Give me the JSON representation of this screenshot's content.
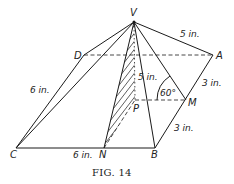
{
  "figure": {
    "caption": "Fig. 14",
    "caption_display": "FIG. 14"
  },
  "vertices": {
    "V": {
      "label": "V",
      "x": 134,
      "y": 22
    },
    "A": {
      "label": "A",
      "x": 213,
      "y": 55
    },
    "B": {
      "label": "B",
      "x": 155,
      "y": 148
    },
    "C": {
      "label": "C",
      "x": 16,
      "y": 148
    },
    "D": {
      "label": "D",
      "x": 84,
      "y": 55
    },
    "M": {
      "label": "M",
      "x": 186,
      "y": 100
    },
    "N": {
      "label": "N",
      "x": 104,
      "y": 148
    },
    "P": {
      "label": "P",
      "x": 135,
      "y": 100
    }
  },
  "measurements": {
    "VA": "5 in.",
    "CD": "6 in.",
    "CN": "6 in.",
    "AM": "3 in.",
    "MB": "3 in.",
    "VP": "5 in.",
    "angle_VMP": "60°"
  },
  "edges": {
    "solid": [
      "VD",
      "VC",
      "VN",
      "VB",
      "VM",
      "VA",
      "CD",
      "CB",
      "BA"
    ],
    "dashed": [
      "DA",
      "PM",
      "NP"
    ],
    "dotted": [
      "VP"
    ]
  }
}
